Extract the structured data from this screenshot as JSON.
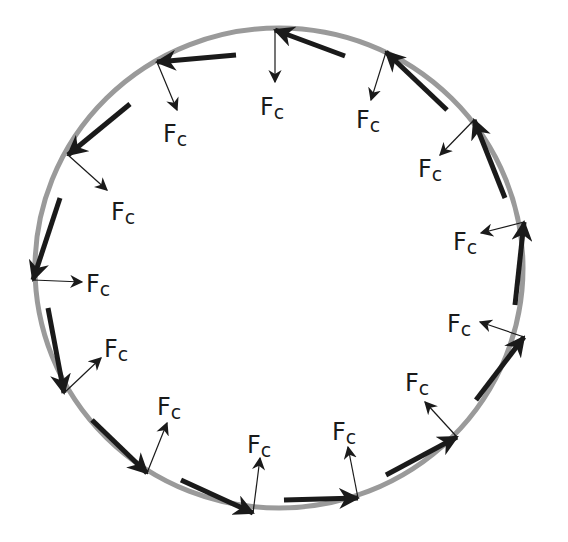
{
  "diagram": {
    "colors": {
      "background": "#ffffff",
      "path": "#9a9a9a",
      "velocity_arrow": "#1a1a1a",
      "force_arrow": "#1a1a1a",
      "label": "#1a1a1a"
    },
    "path": {
      "shape": "ellipse",
      "cx": 279,
      "cy": 268,
      "rx": 244,
      "ry": 240
    },
    "force_label": {
      "main": "F",
      "sub": "c"
    },
    "points": [
      {
        "id": 1,
        "tip": [
          275,
          30
        ],
        "vel_tail": [
          345,
          56
        ],
        "fc_end": [
          275,
          82
        ],
        "label_pos": [
          260,
          115
        ]
      },
      {
        "id": 2,
        "tip": [
          157,
          62
        ],
        "vel_tail": [
          236,
          55
        ],
        "fc_end": [
          177,
          110
        ],
        "label_pos": [
          163,
          142
        ]
      },
      {
        "id": 3,
        "tip": [
          68,
          155
        ],
        "vel_tail": [
          130,
          104
        ],
        "fc_end": [
          107,
          190
        ],
        "label_pos": [
          111,
          220
        ]
      },
      {
        "id": 4,
        "tip": [
          33,
          280
        ],
        "vel_tail": [
          60,
          198
        ],
        "fc_end": [
          82,
          282
        ],
        "label_pos": [
          86,
          292
        ]
      },
      {
        "id": 5,
        "tip": [
          64,
          393
        ],
        "vel_tail": [
          48,
          308
        ],
        "fc_end": [
          101,
          358
        ],
        "label_pos": [
          104,
          357
        ]
      },
      {
        "id": 6,
        "tip": [
          147,
          473
        ],
        "vel_tail": [
          92,
          420
        ],
        "fc_end": [
          167,
          423
        ],
        "label_pos": [
          157,
          415
        ]
      },
      {
        "id": 7,
        "tip": [
          253,
          513
        ],
        "vel_tail": [
          181,
          480
        ],
        "fc_end": [
          260,
          458
        ],
        "label_pos": [
          247,
          453
        ]
      },
      {
        "id": 8,
        "tip": [
          358,
          498
        ],
        "vel_tail": [
          284,
          500
        ],
        "fc_end": [
          348,
          447
        ],
        "label_pos": [
          332,
          440
        ]
      },
      {
        "id": 9,
        "tip": [
          457,
          437
        ],
        "vel_tail": [
          386,
          475
        ],
        "fc_end": [
          425,
          402
        ],
        "label_pos": [
          405,
          391
        ]
      },
      {
        "id": 10,
        "tip": [
          524,
          337
        ],
        "vel_tail": [
          476,
          400
        ],
        "fc_end": [
          480,
          322
        ],
        "label_pos": [
          447,
          332
        ]
      },
      {
        "id": 11,
        "tip": [
          524,
          222
        ],
        "vel_tail": [
          515,
          305
        ],
        "fc_end": [
          481,
          233
        ],
        "label_pos": [
          453,
          250
        ]
      },
      {
        "id": 12,
        "tip": [
          474,
          120
        ],
        "vel_tail": [
          505,
          198
        ],
        "fc_end": [
          440,
          155
        ],
        "label_pos": [
          418,
          177
        ]
      },
      {
        "id": 13,
        "tip": [
          386,
          52
        ],
        "vel_tail": [
          447,
          110
        ],
        "fc_end": [
          371,
          100
        ],
        "label_pos": [
          356,
          128
        ]
      }
    ]
  }
}
